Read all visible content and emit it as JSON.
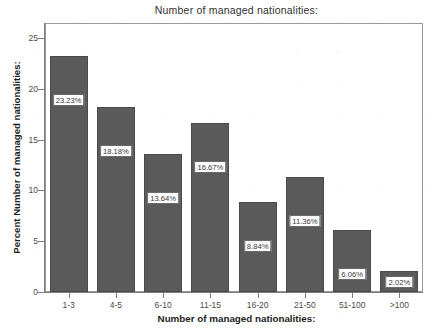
{
  "chart_data": {
    "type": "bar",
    "title": "Number of managed nationalities:",
    "xlabel": "Number of managed nationalities:",
    "ylabel": "Percent Number of managed nationalities:",
    "categories": [
      "1-3",
      "4-5",
      "6-10",
      "11-15",
      "16-20",
      "21-50",
      "51-100",
      ">100"
    ],
    "values": [
      23.23,
      18.18,
      13.64,
      16.67,
      8.84,
      11.36,
      6.06,
      2.02
    ],
    "data_labels": [
      "23.23%",
      "18.18%",
      "13.64%",
      "16.67%",
      "8.84%",
      "11.36%",
      "6.06%",
      "2.02%"
    ],
    "ylim": [
      0,
      26.5
    ],
    "y_ticks": [
      0,
      5,
      10,
      15,
      20,
      25
    ],
    "y_tick_labels": [
      "0",
      "5",
      "10",
      "15",
      "20",
      "25"
    ],
    "grid": false,
    "legend": "none",
    "bar_color": "#5a5a5a",
    "bar_edge_color": "#4a4a4a",
    "plot_background": "#ffffff",
    "axis_color": "#7d7d7d",
    "label_box_background": "#fdfdfd",
    "label_box_border": "#6a6a6a"
  }
}
